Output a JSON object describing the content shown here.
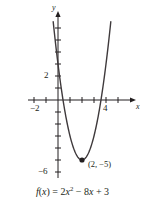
{
  "figure": {
    "caption": "Graph of a parabola with vertex labeled",
    "equation": {
      "fname": "f",
      "open": "(",
      "xvar": "x",
      "close": ")",
      "equals": "=",
      "coef_a": "2",
      "term_x": "x",
      "exponent": "2",
      "minus": "−",
      "coef_b": "8",
      "term_x2": "x",
      "plus": "+",
      "const_c": "3",
      "plain": "f(x) = 2x² − 8x + 3"
    },
    "axes": {
      "x_label": "x",
      "y_label": "y",
      "x_ticks": [
        "-2",
        "4"
      ],
      "y_ticks": [
        "2",
        "-6"
      ],
      "x_tick_neg2": "−2",
      "x_tick_4": "4",
      "y_tick_2": "2",
      "y_tick_neg6": "−6"
    },
    "vertex_label": "(2, −5)",
    "colors": {
      "ink": "#231f20",
      "curve": "#3f3a3c",
      "background": "#ffffff"
    }
  },
  "chart_data": {
    "type": "line",
    "title": "",
    "xlabel": "x",
    "ylabel": "y",
    "function": "f(x) = 2x^2 - 8x + 3",
    "coefficients": {
      "a": 2,
      "b": -8,
      "c": 3
    },
    "vertex": [
      2,
      -5
    ],
    "y_intercept": 3,
    "x_intercepts": [
      0.4189,
      3.5811
    ],
    "xlim": [
      -2.8,
      6.2
    ],
    "ylim": [
      -8.2,
      7.5
    ],
    "xticks": [
      -2,
      4
    ],
    "yticks": [
      2,
      -6
    ],
    "grid": false,
    "legend": false,
    "annotations": [
      {
        "text": "(2, −5)",
        "x": 2,
        "y": -5,
        "marker": "dot"
      }
    ]
  }
}
